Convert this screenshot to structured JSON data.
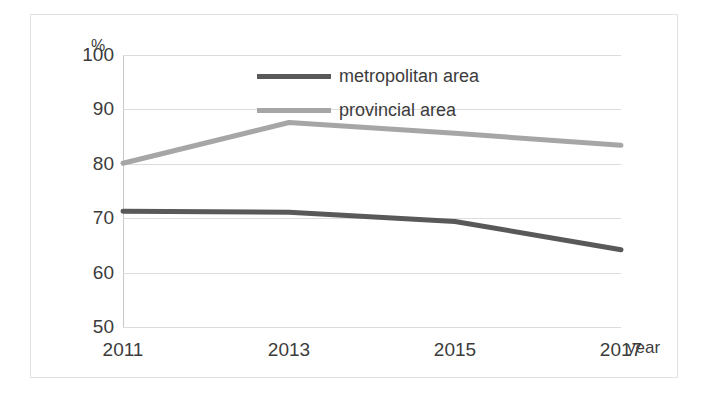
{
  "chart_data": {
    "type": "line",
    "title": "",
    "subtitle": "",
    "xlabel": "year",
    "ylabel": "%",
    "x": [
      2011,
      2013,
      2015,
      2017
    ],
    "categories": [
      "2011",
      "2013",
      "2015",
      "2017"
    ],
    "xticklabels": [
      "2011",
      "2013",
      "2015",
      "2017"
    ],
    "yticklabels": [
      "50",
      "60",
      "70",
      "80",
      "90",
      "100"
    ],
    "yticks": [
      50,
      60,
      70,
      80,
      90,
      100
    ],
    "ylim": [
      50,
      100
    ],
    "xlim": [
      2011,
      2017
    ],
    "grid": "horizontal",
    "legend_position": "top-center",
    "series": [
      {
        "name": "metropolitan area",
        "color": "#595959",
        "values": [
          71.3,
          71.1,
          69.4,
          64.2
        ]
      },
      {
        "name": "provincial area",
        "color": "#a6a6a6",
        "values": [
          80.1,
          87.6,
          85.6,
          83.4
        ]
      }
    ]
  }
}
